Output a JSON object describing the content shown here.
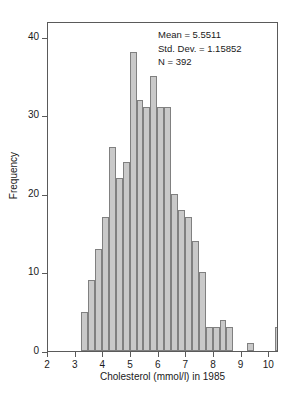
{
  "chart_data": {
    "type": "bar",
    "title": "",
    "xlabel": "Cholesterol (mmol/l) in 1985",
    "ylabel": "Frequency",
    "xlim": [
      2,
      10.35
    ],
    "ylim": [
      0,
      42
    ],
    "grid": false,
    "legend": null,
    "bin_width": 0.25,
    "xticks": [
      2,
      3,
      4,
      5,
      6,
      7,
      8,
      9,
      10
    ],
    "xtick_labels": [
      "2",
      "3",
      "4",
      "5",
      "6",
      "7",
      "8",
      "9",
      "10"
    ],
    "yticks": [
      0,
      10,
      20,
      30,
      40
    ],
    "ytick_labels": [
      "0",
      "10",
      "20",
      "30",
      "40"
    ],
    "bin_starts": [
      3.2,
      3.45,
      3.7,
      3.95,
      4.2,
      4.45,
      4.7,
      4.95,
      5.2,
      5.45,
      5.7,
      5.95,
      6.2,
      6.45,
      6.7,
      6.95,
      7.2,
      7.45,
      7.7,
      7.95,
      8.2,
      8.45,
      8.7,
      8.95,
      9.2,
      9.45,
      9.7,
      9.95,
      10.2
    ],
    "values": [
      5,
      9,
      13,
      17,
      26,
      22,
      24,
      38,
      32,
      31,
      35,
      31,
      31,
      20,
      18,
      17,
      14,
      10,
      3,
      3,
      4,
      3,
      0,
      0,
      1,
      0,
      0,
      0,
      3
    ],
    "categories": [
      "3.20",
      "3.45",
      "3.70",
      "3.95",
      "4.20",
      "4.45",
      "4.70",
      "4.95",
      "5.20",
      "5.45",
      "5.70",
      "5.95",
      "6.20",
      "6.45",
      "6.70",
      "6.95",
      "7.20",
      "7.45",
      "7.70",
      "7.95",
      "8.20",
      "8.45",
      "8.70",
      "8.95",
      "9.20",
      "9.45",
      "9.70",
      "9.95",
      "10.20"
    ],
    "bar_color": "#c9c9c9",
    "bar_edge_color": "#808080",
    "annotations": [
      "Mean = 5.5511",
      "Std. Dev. = 1.15852",
      "N = 392"
    ]
  },
  "stats": {
    "mean_line": "Mean = 5.5511",
    "stddev_line": "Std. Dev. = 1.15852",
    "n_line": "N = 392"
  },
  "axes": {
    "x_title": "Cholesterol (mmol/l) in 1985",
    "y_title": "Frequency"
  }
}
